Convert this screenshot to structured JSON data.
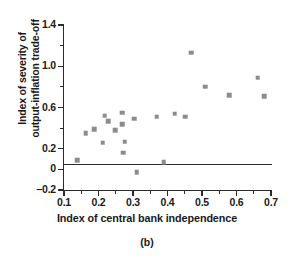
{
  "chart_data": {
    "type": "scatter",
    "title": "",
    "caption": "(b)",
    "xlabel": "Index of central bank independence",
    "ylabel": "Index of severity of output-inflation trade-off",
    "ylabel_line1": "Index of severity of",
    "ylabel_line2": "output-inflation trade-off",
    "xlim": [
      0.1,
      0.7
    ],
    "ylim": [
      -0.2,
      1.4
    ],
    "grid": false,
    "legend": null,
    "xticks": [
      0.1,
      0.2,
      0.3,
      0.4,
      0.5,
      0.6,
      0.7
    ],
    "xtick_labels": [
      "0.1",
      "0.2",
      "0.3",
      "0.4",
      "0.5",
      "0.6",
      "0.7"
    ],
    "xminor_ticks": [
      0.15,
      0.25,
      0.35,
      0.45,
      0.55,
      0.65
    ],
    "yticks": [
      -0.2,
      0,
      0.2,
      0.6,
      1.0,
      1.4
    ],
    "ytick_labels": [
      "−0.2",
      "0",
      "0.2",
      "0.6",
      "1.0",
      "1.4"
    ],
    "yminor_ticks": [
      0.4,
      0.8,
      1.2
    ],
    "marker_color": "#8c8c8c",
    "axis_color": "#2b2b2b",
    "reference_line_y": 0,
    "points": [
      {
        "x": 0.138,
        "y": 0.09
      },
      {
        "x": 0.163,
        "y": 0.35
      },
      {
        "x": 0.188,
        "y": 0.39
      },
      {
        "x": 0.212,
        "y": 0.26
      },
      {
        "x": 0.218,
        "y": 0.52
      },
      {
        "x": 0.228,
        "y": 0.47
      },
      {
        "x": 0.248,
        "y": 0.38
      },
      {
        "x": 0.268,
        "y": 0.55
      },
      {
        "x": 0.268,
        "y": 0.44
      },
      {
        "x": 0.271,
        "y": 0.16
      },
      {
        "x": 0.276,
        "y": 0.27
      },
      {
        "x": 0.303,
        "y": 0.49
      },
      {
        "x": 0.311,
        "y": -0.03
      },
      {
        "x": 0.369,
        "y": 0.51
      },
      {
        "x": 0.389,
        "y": 0.07
      },
      {
        "x": 0.421,
        "y": 0.54
      },
      {
        "x": 0.452,
        "y": 0.51
      },
      {
        "x": 0.468,
        "y": 1.13
      },
      {
        "x": 0.509,
        "y": 0.8
      },
      {
        "x": 0.578,
        "y": 0.72
      },
      {
        "x": 0.661,
        "y": 0.89
      },
      {
        "x": 0.68,
        "y": 0.71
      }
    ]
  }
}
